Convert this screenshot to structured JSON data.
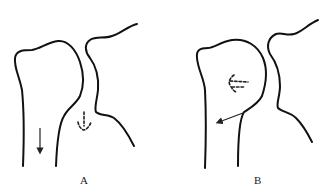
{
  "figure": {
    "panels": [
      {
        "id": "A",
        "label": "A",
        "elements": [
          "humerus-outline",
          "glenoid-scapula-outline",
          "solid-arrow-down",
          "dashed-arrow-up"
        ]
      },
      {
        "id": "B",
        "label": "B",
        "elements": [
          "humerus-outline",
          "glenoid-scapula-outline",
          "solid-arrow-down-left",
          "dashed-arrow-left"
        ]
      }
    ],
    "colors": {
      "line": "#111111",
      "background": "#ffffff"
    }
  }
}
